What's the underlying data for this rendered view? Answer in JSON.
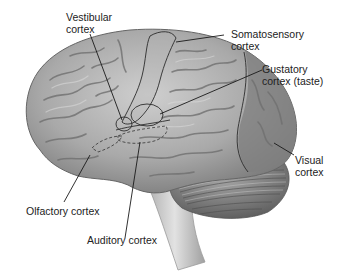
{
  "figure": {
    "colors": {
      "background": "#ffffff",
      "cerebrum": "#a6a6a6",
      "cerebrum_highlight": "#c8c8c8",
      "sulci": "#6e6e6e",
      "visual_region": "#7d7d7d",
      "cerebellum": "#8a8a8a",
      "brainstem": "#c4c4c4",
      "leader_lines": "#1a1a1a",
      "text": "#222222"
    }
  },
  "labels": {
    "vestibular": {
      "line1": "Vestibular",
      "line2": "cortex"
    },
    "somatosensory": {
      "line1": "Somatosensory",
      "line2": "cortex"
    },
    "gustatory": {
      "line1": "Gustatory",
      "line2": "cortex (taste)"
    },
    "visual": {
      "line1": "Visual",
      "line2": "cortex"
    },
    "olfactory": {
      "line1": "Olfactory cortex"
    },
    "auditory": {
      "line1": "Auditory cortex"
    }
  }
}
